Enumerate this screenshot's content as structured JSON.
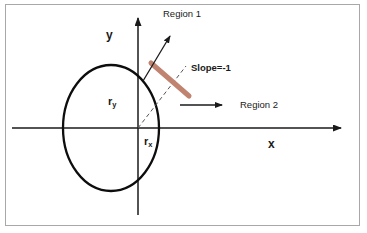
{
  "figure": {
    "background_color": "#ffffff",
    "frame_color": "#a8a8a8",
    "ink_color": "#000000",
    "tangent_color": "#c0836f"
  },
  "axes": {
    "x_label": "x",
    "y_label": "y",
    "origin": {
      "x": 138,
      "y": 128
    },
    "x_axis": {
      "x1": 12,
      "y1": 128,
      "x2": 345,
      "y2": 128
    },
    "y_axis": {
      "x1": 138,
      "y1": 214,
      "x2": 138,
      "y2": 14
    }
  },
  "ellipse": {
    "center_x": 111,
    "center_y": 128,
    "radius_x": 48,
    "radius_y": 63,
    "stroke_width": 2.2
  },
  "labels": {
    "region1": "Region 1",
    "region2": "Region 2",
    "slope": "Slope=-1",
    "radius_y": "r",
    "radius_y_sub": "y",
    "radius_x": "r",
    "radius_x_sub": "x",
    "axis_x": "x",
    "axis_y": "y"
  },
  "annotations": {
    "region1_arrow": {
      "x1": 144,
      "y1": 80,
      "x2": 172,
      "y2": 34
    },
    "region2_arrow": {
      "x1": 182,
      "y1": 105,
      "x2": 224,
      "y2": 105
    },
    "tangent_segment": {
      "x1": 152,
      "y1": 64,
      "x2": 188,
      "y2": 95
    },
    "radius_dashed": {
      "x1": 138,
      "y1": 128,
      "x2": 185,
      "y2": 68
    }
  },
  "label_positions": {
    "region1": {
      "left": 163,
      "top": 9
    },
    "region2": {
      "left": 240,
      "top": 100
    },
    "slope": {
      "left": 191,
      "top": 63
    },
    "radius_y": {
      "left": 108,
      "top": 97
    },
    "radius_x": {
      "left": 144,
      "top": 137
    },
    "axis_y": {
      "left": 106,
      "top": 30
    },
    "axis_x": {
      "left": 268,
      "top": 139
    }
  }
}
